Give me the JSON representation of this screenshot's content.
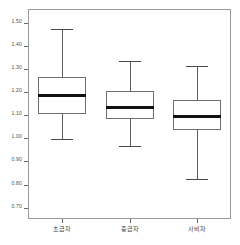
{
  "chart_data": {
    "type": "box",
    "title": "",
    "subtitle": "",
    "xlabel": "",
    "ylabel": "",
    "ylim": [
      0.655,
      1.565
    ],
    "grid": false,
    "legend": null,
    "ytick_labels": [
      "1.50",
      "1.40",
      "1.30",
      "1.20",
      "1.10",
      "1.00",
      "0.90",
      "0.80",
      "0.70"
    ],
    "ytick_values": [
      1.5,
      1.4,
      1.3,
      1.2,
      1.1,
      1.0,
      0.9,
      0.8,
      0.7
    ],
    "categories": [
      "초급자",
      "중급자",
      "사비자"
    ],
    "boxes": [
      {
        "category": "초급자",
        "whisker_low": 1.0,
        "q1": 1.11,
        "median": 1.19,
        "q3": 1.27,
        "whisker_high": 1.48
      },
      {
        "category": "중급자",
        "whisker_low": 0.97,
        "q1": 1.09,
        "median": 1.14,
        "q3": 1.21,
        "whisker_high": 1.34
      },
      {
        "category": "사비자",
        "whisker_low": 0.83,
        "q1": 1.04,
        "median": 1.1,
        "q3": 1.17,
        "whisker_high": 1.32
      }
    ],
    "colors": {
      "box_border": "#6e6e6e",
      "box_fill": "#ffffff",
      "median": "#111111",
      "whisker": "#5e5e5e",
      "frame": "#9a9a9a",
      "tick_text": "#4a4a4a",
      "background": "#ffffff"
    }
  }
}
